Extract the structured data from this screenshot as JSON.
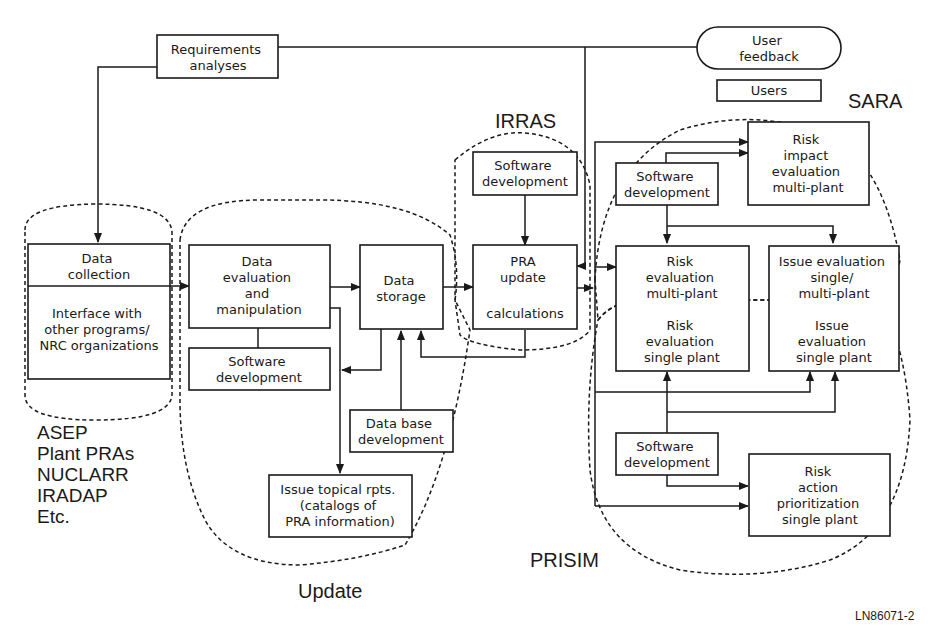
{
  "diagram": {
    "nodes": {
      "requirements": {
        "lines": [
          "Requirements",
          "analyses"
        ]
      },
      "user_feedback": {
        "lines": [
          "User",
          "feedback"
        ]
      },
      "users": {
        "lines": [
          "Users"
        ]
      },
      "data_collection": {
        "lines": [
          "Data",
          "collection"
        ]
      },
      "interface": {
        "lines": [
          "Interface with",
          "other programs/",
          "NRC organizations"
        ]
      },
      "data_eval": {
        "lines": [
          "Data",
          "evaluation",
          "and",
          "manipulation"
        ]
      },
      "sw_update": {
        "lines": [
          "Software",
          "development"
        ]
      },
      "data_storage": {
        "lines": [
          "Data",
          "storage"
        ]
      },
      "db_dev": {
        "lines": [
          "Data base",
          "development"
        ]
      },
      "issue_topical": {
        "lines": [
          "Issue topical rpts.",
          "(catalogs of",
          "PRA information)"
        ]
      },
      "sw_irras": {
        "lines": [
          "Software",
          "development"
        ]
      },
      "pra_update": {
        "lines": [
          "PRA",
          "update",
          "",
          "calculations"
        ]
      },
      "sw_sara": {
        "lines": [
          "Software",
          "development"
        ]
      },
      "risk_impact": {
        "lines": [
          "Risk",
          "impact",
          "evaluation",
          "multi-plant"
        ]
      },
      "risk_eval_multi": {
        "lines": [
          "Risk",
          "evaluation",
          "multi-plant"
        ]
      },
      "issue_eval_multi": {
        "lines": [
          "Issue evaluation",
          "single/",
          "multi-plant"
        ]
      },
      "risk_eval_single": {
        "lines": [
          "Risk",
          "evaluation",
          "single plant"
        ]
      },
      "issue_eval_single": {
        "lines": [
          "Issue",
          "evaluation",
          "single plant"
        ]
      },
      "sw_prisim": {
        "lines": [
          "Software",
          "development"
        ]
      },
      "risk_action": {
        "lines": [
          "Risk",
          "action",
          "prioritization",
          "single plant"
        ]
      }
    },
    "regions": {
      "irras": "IRRAS",
      "sara": "SARA",
      "update": "Update",
      "prisim": "PRISIM"
    },
    "sources": [
      "ASEP",
      "Plant PRAs",
      "NUCLARR",
      "IRADAP",
      "Etc."
    ],
    "figure_id": "LN86071-2"
  }
}
